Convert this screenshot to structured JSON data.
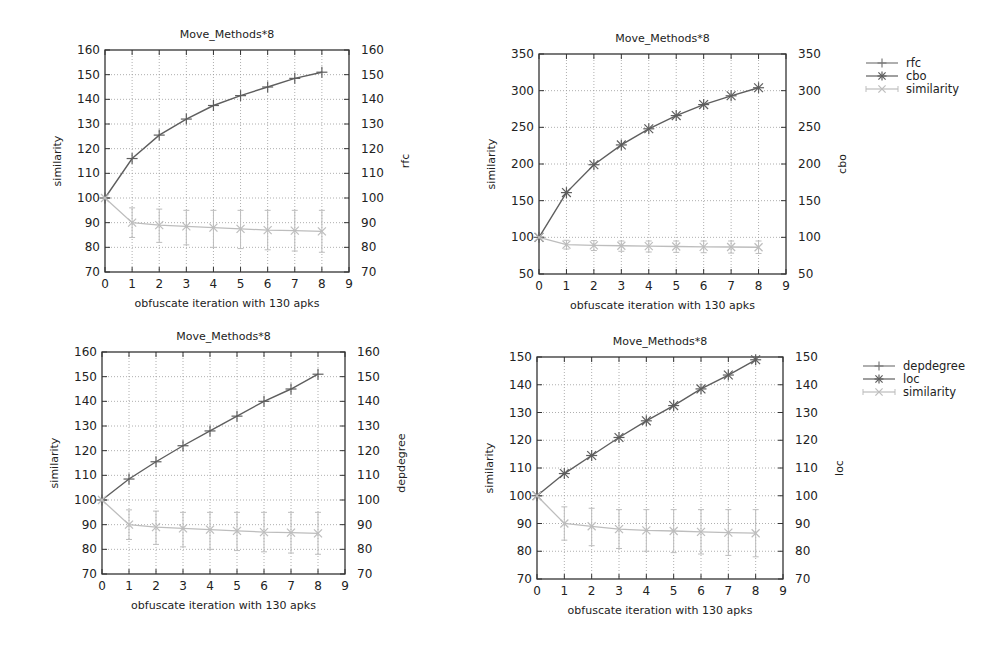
{
  "colors": {
    "frame": "#333333",
    "grid": "#9a9a9a",
    "metric_a": "#7a7a7a",
    "metric_b": "#5e5e5e",
    "similarity": "#bdbdbd"
  },
  "chart_data": [
    {
      "id": "top-left",
      "type": "line",
      "title": "Move_Methods*8",
      "xlabel": "obfuscate iteration with 130 apks",
      "ylabel": "similarity",
      "y2label": "rfc",
      "x": [
        0,
        1,
        2,
        3,
        4,
        5,
        6,
        7,
        8
      ],
      "xlim": [
        0,
        9
      ],
      "xticks": [
        0,
        1,
        2,
        3,
        4,
        5,
        6,
        7,
        8,
        9
      ],
      "ylim": [
        70,
        160
      ],
      "yticks": [
        70,
        80,
        90,
        100,
        110,
        120,
        130,
        140,
        150,
        160
      ],
      "y2ticks": [
        70,
        80,
        90,
        100,
        110,
        120,
        130,
        140,
        150,
        160
      ],
      "grid": true,
      "series": [
        {
          "name": "rfc",
          "marker": "plus",
          "values": [
            100,
            116,
            125.5,
            132,
            137.5,
            141.5,
            145,
            148.5,
            151
          ]
        },
        {
          "name": "similarity",
          "marker": "x",
          "errorbars": true,
          "values": [
            100,
            90,
            89,
            88.5,
            88,
            87.5,
            87,
            86.8,
            86.5
          ],
          "lower": [
            100,
            84,
            82,
            81,
            80,
            79.5,
            79,
            78.5,
            78
          ],
          "upper": [
            100,
            96,
            95.5,
            95,
            95,
            95,
            95,
            95,
            95
          ]
        }
      ],
      "box": {
        "x": 105,
        "y": 50,
        "w": 244,
        "h": 222
      },
      "legend": null
    },
    {
      "id": "top-right",
      "type": "line",
      "title": "Move_Methods*8",
      "xlabel": "obfuscate iteration with 130 apks",
      "ylabel": "similarity",
      "y2label": "cbo",
      "x": [
        0,
        1,
        2,
        3,
        4,
        5,
        6,
        7,
        8
      ],
      "xlim": [
        0,
        9
      ],
      "xticks": [
        0,
        1,
        2,
        3,
        4,
        5,
        6,
        7,
        8,
        9
      ],
      "ylim": [
        50,
        350
      ],
      "yticks": [
        50,
        100,
        150,
        200,
        250,
        300,
        350
      ],
      "y2ticks": [
        50,
        100,
        150,
        200,
        250,
        300,
        350
      ],
      "grid": true,
      "series": [
        {
          "name": "cbo",
          "marker": "star",
          "values": [
            100,
            161,
            199,
            226,
            248,
            266,
            281,
            293,
            304
          ]
        },
        {
          "name": "similarity",
          "marker": "x",
          "errorbars": true,
          "values": [
            100,
            90,
            89,
            88.5,
            88,
            87.5,
            87,
            86.8,
            86.5
          ],
          "lower": [
            100,
            84,
            82,
            81,
            80,
            79.5,
            79,
            78.5,
            78
          ],
          "upper": [
            100,
            96,
            95.5,
            95,
            95,
            95,
            95,
            95,
            95
          ]
        }
      ],
      "box": {
        "x": 539,
        "y": 54,
        "w": 247,
        "h": 220
      },
      "legend": {
        "position": "right-outside",
        "entries": [
          "rfc",
          "cbo",
          "similarity"
        ]
      }
    },
    {
      "id": "bottom-left",
      "type": "line",
      "title": "Move_Methods*8",
      "xlabel": "obfuscate iteration with 130 apks",
      "ylabel": "similarity",
      "y2label": "depdegree",
      "x": [
        0,
        1,
        2,
        3,
        4,
        5,
        6,
        7,
        8
      ],
      "xlim": [
        0,
        9
      ],
      "xticks": [
        0,
        1,
        2,
        3,
        4,
        5,
        6,
        7,
        8,
        9
      ],
      "ylim": [
        70,
        160
      ],
      "yticks": [
        70,
        80,
        90,
        100,
        110,
        120,
        130,
        140,
        150,
        160
      ],
      "y2ticks": [
        70,
        80,
        90,
        100,
        110,
        120,
        130,
        140,
        150,
        160
      ],
      "grid": true,
      "series": [
        {
          "name": "depdegree",
          "marker": "plus",
          "values": [
            100,
            108.5,
            115.5,
            122,
            128,
            134,
            140,
            145,
            151
          ]
        },
        {
          "name": "similarity",
          "marker": "x",
          "errorbars": true,
          "values": [
            100,
            90,
            89,
            88.5,
            88,
            87.5,
            87,
            86.8,
            86.5
          ],
          "lower": [
            100,
            84,
            82,
            81,
            80,
            79.5,
            79,
            78.5,
            78
          ],
          "upper": [
            100,
            96,
            95.5,
            95,
            95,
            95,
            95,
            95,
            95
          ]
        }
      ],
      "box": {
        "x": 102,
        "y": 352,
        "w": 243,
        "h": 222
      },
      "legend": null
    },
    {
      "id": "bottom-right",
      "type": "line",
      "title": "Move_Methods*8",
      "xlabel": "obfuscate iteration with 130 apks",
      "ylabel": "similarity",
      "y2label": "loc",
      "x": [
        0,
        1,
        2,
        3,
        4,
        5,
        6,
        7,
        8
      ],
      "xlim": [
        0,
        9
      ],
      "xticks": [
        0,
        1,
        2,
        3,
        4,
        5,
        6,
        7,
        8,
        9
      ],
      "ylim": [
        70,
        150
      ],
      "yticks": [
        70,
        80,
        90,
        100,
        110,
        120,
        130,
        140,
        150
      ],
      "y2ticks": [
        70,
        80,
        90,
        100,
        110,
        120,
        130,
        140,
        150
      ],
      "grid": true,
      "series": [
        {
          "name": "loc",
          "marker": "star",
          "values": [
            100,
            108,
            114.5,
            121,
            127,
            132.5,
            138.5,
            143.5,
            149
          ]
        },
        {
          "name": "similarity",
          "marker": "x",
          "errorbars": true,
          "values": [
            100,
            90,
            89,
            88,
            87.5,
            87.3,
            87,
            86.7,
            86.5
          ],
          "lower": [
            100,
            84,
            82,
            81,
            80,
            79.5,
            79,
            78.5,
            78
          ],
          "upper": [
            100,
            96,
            95.5,
            95,
            95,
            95,
            95,
            95,
            95
          ]
        }
      ],
      "box": {
        "x": 537,
        "y": 357,
        "w": 246,
        "h": 222
      },
      "legend": {
        "position": "right-outside",
        "entries": [
          "depdegree",
          "loc",
          "similarity"
        ]
      }
    }
  ]
}
